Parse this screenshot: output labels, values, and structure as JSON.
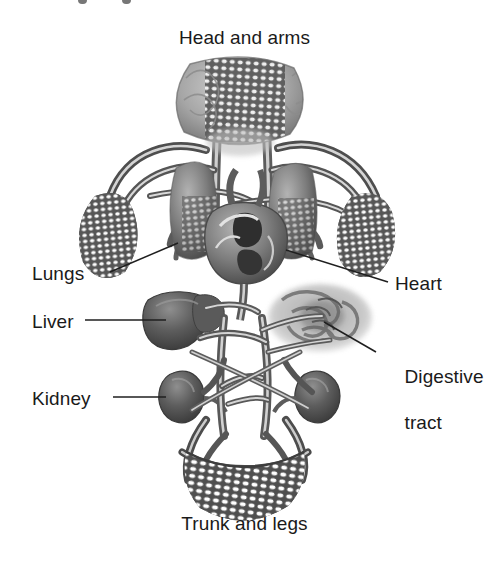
{
  "figure": {
    "type": "anatomical-diagram",
    "background_color": "#ffffff",
    "ink_color": "#1a1a1a"
  },
  "titles": {
    "top": "Head and arms",
    "bottom": "Trunk and legs"
  },
  "labels": {
    "lungs": "Lungs",
    "liver": "Liver",
    "kidney": "Kidney",
    "heart": "Heart",
    "digestive_line1": "Digestive",
    "digestive_line2": "tract"
  },
  "organs": [
    {
      "name": "brain",
      "label_ref": "top",
      "position": "top-center",
      "fill": "#8a8a8a"
    },
    {
      "name": "left-arm-capillary-bed",
      "label_ref": "top",
      "position": "upper-left",
      "fill": "#6f6f6f"
    },
    {
      "name": "right-arm-capillary-bed",
      "label_ref": "top",
      "position": "upper-right",
      "fill": "#6f6f6f"
    },
    {
      "name": "left-lung",
      "label_ref": "lungs",
      "position": "mid-left",
      "fill": "#8d8d8d"
    },
    {
      "name": "right-lung",
      "label_ref": "lungs",
      "position": "mid-right",
      "fill": "#8d8d8d"
    },
    {
      "name": "heart",
      "label_ref": "heart",
      "position": "center",
      "fill": "#7a7a7a"
    },
    {
      "name": "liver",
      "label_ref": "liver",
      "position": "left-of-center",
      "fill": "#5e5e5e"
    },
    {
      "name": "digestive-tract",
      "label_ref": "digestive_line1",
      "position": "right-of-center",
      "fill": "#9a9a9a"
    },
    {
      "name": "left-kidney",
      "label_ref": "kidney",
      "position": "lower-left",
      "fill": "#666666"
    },
    {
      "name": "right-kidney",
      "label_ref": "kidney",
      "position": "lower-right",
      "fill": "#666666"
    },
    {
      "name": "trunk-legs-capillary-bed",
      "label_ref": "bottom",
      "position": "bottom-center",
      "fill": "#555555"
    }
  ],
  "leader_lines": [
    {
      "for": "lungs",
      "from": [
        110,
        272
      ],
      "to": [
        175,
        243
      ]
    },
    {
      "for": "liver",
      "from": [
        85,
        320
      ],
      "to": [
        168,
        320
      ]
    },
    {
      "for": "kidney",
      "from": [
        113,
        397
      ],
      "to": [
        168,
        397
      ]
    },
    {
      "for": "heart",
      "from": [
        388,
        282
      ],
      "to": [
        288,
        252
      ]
    },
    {
      "for": "digestive",
      "from": [
        376,
        352
      ],
      "to": [
        322,
        310
      ]
    }
  ],
  "vessel_color": "#707070",
  "vessel_highlight": "#e8e8e8"
}
